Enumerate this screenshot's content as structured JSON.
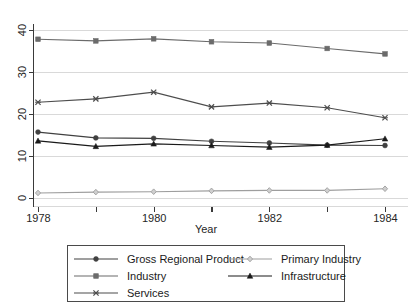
{
  "chart_data": {
    "type": "line",
    "title": "",
    "xlabel": "Year",
    "ylabel": "",
    "x": [
      1978,
      1979,
      1980,
      1981,
      1982,
      1983,
      1984
    ],
    "xtick_labels": [
      "1978",
      "",
      "1980",
      "",
      "1982",
      "",
      "1984"
    ],
    "ytick_labels": [
      "0",
      "10",
      "20",
      "30",
      "40"
    ],
    "ytick_values": [
      0,
      10,
      20,
      30,
      40
    ],
    "xlim": [
      1978,
      1984
    ],
    "ylim": [
      0,
      40
    ],
    "grid": "horizontal",
    "legend_position": "bottom",
    "series": [
      {
        "name": "Gross Regional Product",
        "marker": "filled-circle",
        "color": "#404040",
        "values": [
          15.7,
          14.3,
          14.2,
          13.5,
          13.1,
          12.6,
          12.5
        ]
      },
      {
        "name": "Industry",
        "marker": "filled-square",
        "color": "#6b6b6b",
        "values": [
          37.8,
          37.4,
          37.9,
          37.2,
          36.9,
          35.6,
          34.3
        ]
      },
      {
        "name": "Services",
        "marker": "cross",
        "color": "#4d4d4d",
        "values": [
          22.8,
          23.6,
          25.2,
          21.7,
          22.6,
          21.5,
          19.1
        ]
      },
      {
        "name": "Primary Industry",
        "marker": "open-diamond",
        "color": "#9e9e9e",
        "values": [
          1.2,
          1.4,
          1.5,
          1.7,
          1.8,
          1.8,
          2.2
        ]
      },
      {
        "name": "Infrastructure",
        "marker": "filled-triangle",
        "color": "#1a1a1a",
        "values": [
          13.6,
          12.3,
          12.9,
          12.5,
          12.1,
          12.6,
          14.1
        ]
      }
    ]
  },
  "legend": {
    "entries": [
      {
        "label": "Gross Regional Product",
        "column": 0,
        "row": 0
      },
      {
        "label": "Industry",
        "column": 0,
        "row": 1
      },
      {
        "label": "Services",
        "column": 0,
        "row": 2
      },
      {
        "label": "Primary Industry",
        "column": 1,
        "row": 0
      },
      {
        "label": "Infrastructure",
        "column": 1,
        "row": 1
      }
    ]
  },
  "axes": {
    "x_title": "Year",
    "y_title": ""
  }
}
